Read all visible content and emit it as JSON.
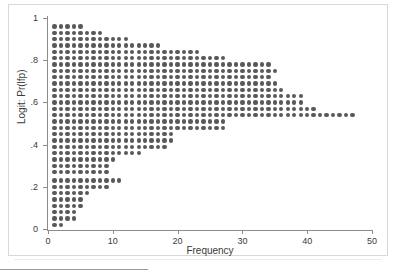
{
  "figure": {
    "background_color": "#ffffff",
    "frame_color": "#d8d8d8",
    "dot_color": "#595959",
    "axis_color": "#8c8c8c"
  },
  "axes": {
    "x_title": "Frequency",
    "y_title": "Logit: Pr(lfp)",
    "x_ticks": [
      "0",
      "10",
      "20",
      "30",
      "40",
      "50"
    ],
    "y_ticks": [
      "0",
      ".2",
      ".4",
      ".6",
      ".8",
      "1"
    ]
  },
  "chart_data": {
    "type": "scatter",
    "title": "",
    "xlabel": "Frequency",
    "ylabel": "Logit: Pr(lfp)",
    "xlim": [
      0,
      50
    ],
    "ylim": [
      0,
      1
    ],
    "grid": false,
    "legend": "none",
    "marker": "filled-circle",
    "marker_color": "#595959",
    "x_tick_values": [
      0,
      10,
      20,
      30,
      40,
      50
    ],
    "y_tick_values": [
      0,
      0.2,
      0.4,
      0.6,
      0.8,
      1.0
    ],
    "bin_centers": [
      0.02,
      0.05,
      0.08,
      0.11,
      0.14,
      0.17,
      0.2,
      0.23,
      0.27,
      0.3,
      0.33,
      0.36,
      0.39,
      0.42,
      0.45,
      0.48,
      0.51,
      0.54,
      0.57,
      0.6,
      0.63,
      0.66,
      0.69,
      0.72,
      0.75,
      0.78,
      0.81,
      0.84,
      0.87,
      0.9,
      0.93,
      0.96
    ],
    "frequencies": [
      2,
      4,
      4,
      5,
      5,
      6,
      9,
      11,
      9,
      9,
      10,
      14,
      18,
      19,
      19,
      27,
      27,
      47,
      41,
      39,
      39,
      36,
      35,
      34,
      35,
      34,
      27,
      23,
      17,
      12,
      8,
      5
    ]
  }
}
